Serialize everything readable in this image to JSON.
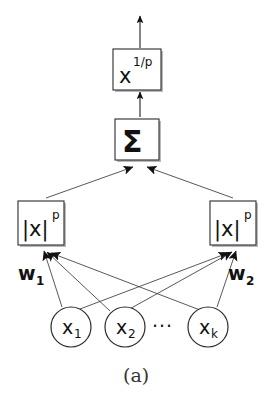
{
  "figure": {
    "caption": "(a)",
    "kind": "diagram"
  },
  "output": {
    "arrow_name": "output-arrow"
  },
  "nodes": {
    "root_power": {
      "base": "x",
      "exponent": "1/p"
    },
    "sum": {
      "symbol": "Σ"
    },
    "power_units": [
      {
        "id": "left",
        "base": "|x|",
        "exponent": "p"
      },
      {
        "id": "right",
        "base": "|x|",
        "exponent": "p"
      }
    ]
  },
  "weights": [
    {
      "symbol": "w",
      "subscript": "1"
    },
    {
      "symbol": "w",
      "subscript": "2"
    }
  ],
  "inputs": [
    {
      "symbol": "x",
      "subscript": "1"
    },
    {
      "symbol": "x",
      "subscript": "2"
    },
    {
      "symbol": "x",
      "subscript": "k"
    }
  ],
  "ellipsis": "···",
  "colors": {
    "stroke": "#2b2b2b",
    "edge": "#3a3a3a",
    "fill": "#ffffff",
    "shadow": "#b9b9b9",
    "text": "#111111",
    "caption": "#333333"
  }
}
